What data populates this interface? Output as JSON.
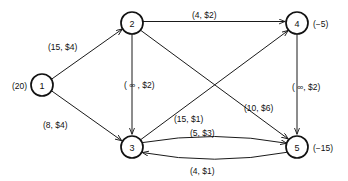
{
  "diagram": {
    "type": "network-flow-graph",
    "title": "",
    "nodes": [
      {
        "id": "1",
        "label": "1",
        "supply_label": "(20)",
        "supply_value": 20,
        "x": 42,
        "y": 85,
        "r": 11
      },
      {
        "id": "2",
        "label": "2",
        "supply_label": "",
        "supply_value": 0,
        "x": 132,
        "y": 23,
        "r": 11
      },
      {
        "id": "3",
        "label": "3",
        "supply_label": "",
        "supply_value": 0,
        "x": 132,
        "y": 147,
        "r": 11
      },
      {
        "id": "4",
        "label": "4",
        "supply_label": "(−5)",
        "supply_value": -5,
        "x": 297,
        "y": 23,
        "r": 11
      },
      {
        "id": "5",
        "label": "5",
        "supply_label": "(−15)",
        "supply_value": -15,
        "x": 297,
        "y": 147,
        "r": 11
      }
    ],
    "edges": [
      {
        "id": "e12",
        "from": "1",
        "to": "2",
        "label": "(15, $4)",
        "capacity": "15",
        "cost": "$4",
        "shape": "straight"
      },
      {
        "id": "e13",
        "from": "1",
        "to": "3",
        "label": "(8, $4)",
        "capacity": "8",
        "cost": "$4",
        "shape": "straight"
      },
      {
        "id": "e24",
        "from": "2",
        "to": "4",
        "label": "(4, $2)",
        "capacity": "4",
        "cost": "$2",
        "shape": "straight"
      },
      {
        "id": "e23",
        "from": "2",
        "to": "3",
        "label": "( ∞ , $2)",
        "capacity": "∞",
        "cost": "$2",
        "shape": "straight"
      },
      {
        "id": "e25",
        "from": "2",
        "to": "5",
        "label": "(10, $6)",
        "capacity": "10",
        "cost": "$6",
        "shape": "straight"
      },
      {
        "id": "e34",
        "from": "3",
        "to": "4",
        "label": "(15, $1)",
        "capacity": "15",
        "cost": "$1",
        "shape": "straight"
      },
      {
        "id": "e45",
        "from": "4",
        "to": "5",
        "label": "( ∞, $2)",
        "capacity": "∞",
        "cost": "$2",
        "shape": "straight"
      },
      {
        "id": "e35",
        "from": "3",
        "to": "5",
        "label": "(5, $3)",
        "capacity": "5",
        "cost": "$3",
        "shape": "curve-upper"
      },
      {
        "id": "e53",
        "from": "5",
        "to": "3",
        "label": "(4, $1)",
        "capacity": "4",
        "cost": "$1",
        "shape": "curve-lower"
      }
    ],
    "edge_label_positions": [
      {
        "id": "lbl-e12",
        "text_key": "e12",
        "x": 48,
        "y": 47,
        "anchor": "start"
      },
      {
        "id": "lbl-e13",
        "text_key": "e13",
        "x": 43,
        "y": 125,
        "anchor": "start"
      },
      {
        "id": "lbl-e24",
        "text_key": "e24",
        "x": 192,
        "y": 15,
        "anchor": "start"
      },
      {
        "id": "lbl-e23",
        "text_key": "e23",
        "x": 124,
        "y": 85,
        "anchor": "start"
      },
      {
        "id": "lbl-e25",
        "text_key": "e25",
        "x": 244,
        "y": 108,
        "anchor": "start"
      },
      {
        "id": "lbl-e34",
        "text_key": "e34",
        "x": 174,
        "y": 119,
        "anchor": "start"
      },
      {
        "id": "lbl-e45",
        "text_key": "e45",
        "x": 292,
        "y": 87,
        "anchor": "start"
      },
      {
        "id": "lbl-e35",
        "text_key": "e35",
        "x": 190,
        "y": 133,
        "anchor": "start"
      },
      {
        "id": "lbl-e53",
        "text_key": "e53",
        "x": 190,
        "y": 171,
        "anchor": "start"
      }
    ],
    "colors": {
      "stroke": "#1a1a1a",
      "node_stroke": "#111111",
      "node_fill": "#ffffff",
      "background": "#ffffff",
      "text": "#111111"
    }
  }
}
